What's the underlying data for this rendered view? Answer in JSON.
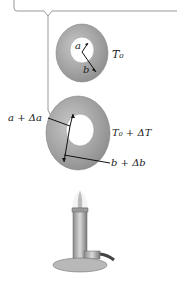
{
  "diagram": {
    "title_cutoff": "...",
    "ring_initial": {
      "inner_radius_label": "a",
      "outer_radius_label": "b",
      "temperature_label": "T₀"
    },
    "ring_heated": {
      "inner_radius_label": "a + Δa",
      "outer_radius_label": "b + Δb",
      "temperature_label": "T₀ + ΔT"
    },
    "heat_source": "bunsen-burner"
  }
}
